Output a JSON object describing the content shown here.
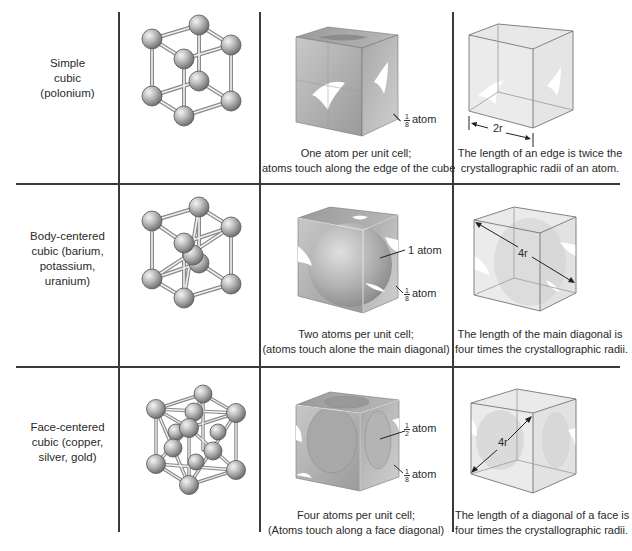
{
  "table": {
    "rows": [
      {
        "structure": "Simple cubic (polonium)",
        "structure_lines": [
          "Simple",
          "cubic",
          "(polonium)"
        ],
        "packing_caption": [
          "One atom per unit cell;",
          "atoms touch along the edge of the cube"
        ],
        "annotations": [
          {
            "numerator": "1",
            "denominator": "8",
            "text": "atom"
          }
        ],
        "geometry_label": "2r",
        "geometry_caption": [
          "The length of an edge is twice the",
          "crystallographic radii of an atom."
        ]
      },
      {
        "structure": "Body-centered cubic (barium, potassium, uranium)",
        "structure_lines": [
          "Body-centered",
          "cubic (barium,",
          "potassium,",
          "uranium)"
        ],
        "packing_caption": [
          "Two atoms per unit cell;",
          "(atoms touch alone the main diagonal)"
        ],
        "annotations": [
          {
            "text": "1 atom"
          },
          {
            "numerator": "1",
            "denominator": "8",
            "text": "atom"
          }
        ],
        "geometry_label": "4r",
        "geometry_caption": [
          "The length of the main diagonal is",
          "four times the crystallographic radii."
        ]
      },
      {
        "structure": "Face-centered cubic (copper, silver, gold)",
        "structure_lines": [
          "Face-centered",
          "cubic (copper,",
          "silver, gold)"
        ],
        "packing_caption": [
          "Four atoms per unit cell;",
          "(Atoms touch along a face diagonal)"
        ],
        "annotations": [
          {
            "numerator": "1",
            "denominator": "2",
            "text": "atom"
          },
          {
            "numerator": "1",
            "denominator": "8",
            "text": "atom"
          }
        ],
        "geometry_label": "4r",
        "geometry_caption": [
          "The length of a diagonal of a face is",
          "four times the crystallographic radii."
        ]
      }
    ]
  },
  "colors": {
    "grid_line": "#3a3a3a",
    "atom_light": "#e6e6e6",
    "atom_dark": "#7a7a7a",
    "cube_face": "#b8b8b8"
  }
}
